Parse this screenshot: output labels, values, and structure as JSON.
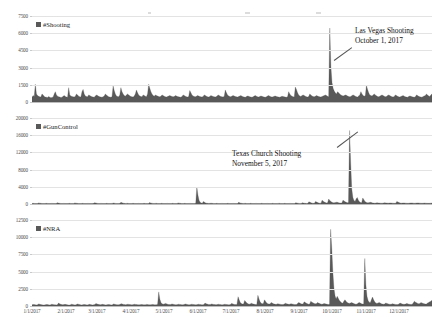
{
  "figure": {
    "background": "#ffffff",
    "series_color": "#595959",
    "grid_color": "#e3e3e3"
  },
  "top_artifacts": [
    {
      "x": 148,
      "y": 12,
      "w": 3,
      "h": 2
    },
    {
      "x": 245,
      "y": 12,
      "w": 5,
      "h": 2
    },
    {
      "x": 316,
      "y": 12,
      "w": 5,
      "h": 2
    }
  ],
  "xaxis": {
    "label": "",
    "ticks": [
      "1/1/2017",
      "2/1/2017",
      "3/1/2017",
      "4/1/2017",
      "5/1/2017",
      "6/1/2017",
      "7/1/2017",
      "8/1/2017",
      "9/1/2017",
      "10/1/2017",
      "11/1/2017",
      "12/1/2017"
    ],
    "range_start": "1/1/2017",
    "range_end": "12/31/2017"
  },
  "panels": [
    {
      "id": "shooting",
      "legend_label": "#Shooting",
      "yticks": [
        "0",
        "1500",
        "3000",
        "4500",
        "6000",
        "7500"
      ],
      "ymax": 7500,
      "annotation": {
        "line1": "Las Vegas Shooting",
        "line2": "October 1, 2017"
      }
    },
    {
      "id": "guncontrol",
      "legend_label": "#GunControl",
      "yticks": [
        "0",
        "4000",
        "8000",
        "12000",
        "16000",
        "20000"
      ],
      "ymax": 20000,
      "annotation": {
        "line1": "Texas Church Shooting",
        "line2": "November 5, 2017"
      }
    },
    {
      "id": "nra",
      "legend_label": "#NRA",
      "yticks": [
        "0",
        "2500",
        "5000",
        "7500",
        "10000",
        "12500"
      ],
      "ymax": 12500,
      "annotation": null
    }
  ],
  "chart_data": [
    {
      "type": "area",
      "id": "shooting",
      "title": "",
      "series_name": "#Shooting",
      "xlabel": "",
      "ylabel": "",
      "ylim": [
        0,
        7500
      ],
      "ytick_values": [
        0,
        1500,
        3000,
        4500,
        6000,
        7500
      ],
      "xtick_labels": [
        "1/1/2017",
        "2/1/2017",
        "3/1/2017",
        "4/1/2017",
        "5/1/2017",
        "6/1/2017",
        "7/1/2017",
        "8/1/2017",
        "9/1/2017",
        "10/1/2017",
        "11/1/2017",
        "12/1/2017"
      ],
      "grid": true,
      "legend_position": "top-left",
      "annotations": [
        {
          "text": "Las Vegas Shooting October 1, 2017",
          "x_day": 273,
          "y_value": 6400
        }
      ],
      "x_unit": "day_of_year_2017",
      "values": [
        420,
        560,
        480,
        1550,
        700,
        560,
        500,
        450,
        430,
        700,
        620,
        480,
        430,
        420,
        400,
        480,
        420,
        380,
        400,
        430,
        700,
        900,
        620,
        500,
        450,
        430,
        400,
        420,
        500,
        560,
        480,
        430,
        420,
        1250,
        620,
        520,
        480,
        450,
        430,
        500,
        700,
        620,
        500,
        460,
        430,
        900,
        1100,
        700,
        520,
        480,
        450,
        620,
        560,
        500,
        460,
        430,
        420,
        520,
        620,
        560,
        500,
        450,
        430,
        420,
        460,
        520,
        700,
        620,
        520,
        460,
        430,
        420,
        460,
        1400,
        1000,
        700,
        520,
        480,
        450,
        620,
        1250,
        900,
        700,
        560,
        500,
        620,
        700,
        620,
        540,
        480,
        450,
        430,
        520,
        700,
        1050,
        800,
        620,
        520,
        480,
        450,
        620,
        560,
        500,
        460,
        700,
        1550,
        1200,
        900,
        700,
        560,
        500,
        620,
        560,
        520,
        480,
        450,
        500,
        620,
        560,
        500,
        460,
        430,
        480,
        520,
        560,
        520,
        480,
        450,
        480,
        560,
        520,
        480,
        450,
        430,
        420,
        480,
        620,
        560,
        500,
        460,
        430,
        480,
        1000,
        800,
        620,
        520,
        480,
        450,
        500,
        560,
        520,
        480,
        450,
        430,
        480,
        620,
        560,
        500,
        460,
        430,
        480,
        560,
        520,
        480,
        450,
        430,
        480,
        560,
        620,
        520,
        480,
        450,
        430,
        500,
        1050,
        800,
        620,
        520,
        480,
        450,
        520,
        560,
        520,
        480,
        450,
        430,
        480,
        520,
        560,
        500,
        460,
        430,
        420,
        480,
        520,
        500,
        460,
        430,
        420,
        450,
        520,
        560,
        500,
        460,
        430,
        480,
        520,
        500,
        460,
        430,
        420,
        460,
        520,
        560,
        500,
        460,
        430,
        450,
        500,
        520,
        480,
        450,
        430,
        420,
        460,
        500,
        480,
        450,
        430,
        420,
        450,
        900,
        700,
        560,
        500,
        460,
        430,
        1300,
        1100,
        800,
        620,
        520,
        480,
        560,
        620,
        560,
        500,
        460,
        430,
        480,
        700,
        620,
        520,
        480,
        450,
        500,
        560,
        520,
        480,
        450,
        430,
        480,
        520,
        560,
        620,
        560,
        500,
        460,
        6450,
        3100,
        1700,
        1200,
        950,
        800,
        700,
        900,
        800,
        700,
        620,
        560,
        520,
        560,
        620,
        580,
        520,
        480,
        450,
        480,
        560,
        620,
        560,
        500,
        460,
        430,
        520,
        620,
        900,
        700,
        560,
        500,
        560,
        1450,
        1100,
        800,
        620,
        560,
        520,
        620,
        700,
        620,
        540,
        480,
        450,
        500,
        560,
        620,
        560,
        500,
        460,
        480,
        560,
        620,
        560,
        500,
        460,
        430,
        480,
        620,
        560,
        500,
        460,
        430,
        480,
        520,
        560,
        500,
        460,
        430,
        420,
        480,
        520,
        500,
        460,
        430,
        420,
        450,
        620,
        560,
        500,
        460,
        430,
        420,
        480,
        520,
        560,
        700,
        620,
        520,
        480,
        620,
        700
      ]
    },
    {
      "type": "area",
      "id": "guncontrol",
      "title": "",
      "series_name": "#GunControl",
      "xlabel": "",
      "ylabel": "",
      "ylim": [
        0,
        20000
      ],
      "ytick_values": [
        0,
        4000,
        8000,
        12000,
        16000,
        20000
      ],
      "xtick_labels": [
        "1/1/2017",
        "2/1/2017",
        "3/1/2017",
        "4/1/2017",
        "5/1/2017",
        "6/1/2017",
        "7/1/2017",
        "8/1/2017",
        "9/1/2017",
        "10/1/2017",
        "11/1/2017",
        "12/1/2017"
      ],
      "grid": true,
      "legend_position": "top-left",
      "annotations": [
        {
          "text": "Texas Church Shooting November 5, 2017",
          "x_day": 309,
          "y_value": 17000
        }
      ],
      "x_unit": "day_of_year_2017",
      "values": [
        120,
        150,
        130,
        110,
        100,
        120,
        260,
        200,
        150,
        130,
        110,
        100,
        120,
        150,
        130,
        110,
        100,
        120,
        140,
        120,
        110,
        100,
        120,
        300,
        220,
        160,
        130,
        110,
        120,
        140,
        120,
        110,
        100,
        120,
        150,
        130,
        110,
        100,
        120,
        260,
        200,
        150,
        120,
        110,
        100,
        120,
        150,
        130,
        110,
        100,
        120,
        140,
        120,
        110,
        100,
        120,
        150,
        300,
        230,
        170,
        130,
        110,
        120,
        140,
        120,
        110,
        100,
        120,
        150,
        130,
        110,
        100,
        120,
        140,
        220,
        180,
        140,
        120,
        110,
        120,
        150,
        380,
        280,
        200,
        150,
        120,
        140,
        160,
        130,
        110,
        100,
        120,
        150,
        130,
        110,
        100,
        120,
        140,
        120,
        110,
        100,
        120,
        150,
        130,
        110,
        100,
        120,
        320,
        240,
        180,
        140,
        120,
        140,
        160,
        130,
        110,
        100,
        120,
        150,
        130,
        110,
        100,
        120,
        140,
        120,
        110,
        100,
        120,
        150,
        130,
        110,
        100,
        120,
        260,
        200,
        150,
        120,
        110,
        120,
        150,
        130,
        110,
        100,
        120,
        140,
        120,
        110,
        100,
        120,
        150,
        3950,
        2100,
        900,
        400,
        250,
        200,
        600,
        400,
        250,
        180,
        150,
        130,
        160,
        180,
        150,
        130,
        110,
        120,
        150,
        130,
        110,
        100,
        120,
        140,
        120,
        110,
        100,
        120,
        150,
        130,
        110,
        100,
        120,
        140,
        120,
        110,
        100,
        120,
        380,
        280,
        200,
        150,
        120,
        140,
        160,
        130,
        110,
        100,
        120,
        150,
        130,
        110,
        100,
        120,
        140,
        120,
        110,
        100,
        120,
        150,
        130,
        110,
        100,
        120,
        140,
        120,
        110,
        100,
        120,
        150,
        130,
        110,
        100,
        120,
        140,
        160,
        130,
        110,
        100,
        120,
        150,
        130,
        110,
        100,
        120,
        140,
        120,
        110,
        100,
        120,
        300,
        240,
        180,
        140,
        120,
        140,
        300,
        240,
        180,
        150,
        130,
        150,
        520,
        380,
        280,
        200,
        160,
        180,
        600,
        450,
        320,
        240,
        180,
        200,
        900,
        650,
        480,
        340,
        260,
        300,
        1150,
        800,
        560,
        400,
        300,
        280,
        350,
        420,
        380,
        300,
        250,
        220,
        260,
        900,
        700,
        500,
        380,
        300,
        320,
        17100,
        9500,
        3500,
        1500,
        800,
        600,
        1200,
        1500,
        900,
        500,
        350,
        300,
        1400,
        1000,
        600,
        400,
        300,
        280,
        350,
        400,
        320,
        260,
        220,
        200,
        240,
        300,
        260,
        220,
        200,
        180,
        200,
        260,
        300,
        260,
        220,
        200,
        220,
        260,
        240,
        200,
        180,
        160,
        180,
        600,
        450,
        320,
        240,
        200,
        220,
        260,
        240,
        200,
        180,
        160,
        180,
        220,
        260,
        240,
        200,
        180,
        200,
        240,
        260,
        240,
        200,
        180,
        160,
        180,
        220,
        200,
        180,
        160,
        150,
        170,
        200,
        220
      ]
    },
    {
      "type": "area",
      "id": "nra",
      "title": "",
      "series_name": "#NRA",
      "xlabel": "",
      "ylabel": "",
      "ylim": [
        0,
        12500
      ],
      "ytick_values": [
        0,
        2500,
        5000,
        7500,
        10000,
        12500
      ],
      "xtick_labels": [
        "1/1/2017",
        "2/1/2017",
        "3/1/2017",
        "4/1/2017",
        "5/1/2017",
        "6/1/2017",
        "7/1/2017",
        "8/1/2017",
        "9/1/2017",
        "10/1/2017",
        "11/1/2017",
        "12/1/2017"
      ],
      "grid": true,
      "legend_position": "top-left",
      "annotations": [],
      "x_unit": "day_of_year_2017",
      "values": [
        180,
        220,
        200,
        170,
        160,
        180,
        300,
        260,
        200,
        180,
        160,
        150,
        180,
        220,
        200,
        170,
        160,
        180,
        260,
        220,
        190,
        170,
        160,
        180,
        420,
        340,
        260,
        200,
        180,
        200,
        240,
        200,
        180,
        160,
        150,
        180,
        260,
        220,
        180,
        160,
        180,
        300,
        260,
        220,
        180,
        160,
        180,
        220,
        200,
        170,
        160,
        180,
        240,
        200,
        180,
        160,
        180,
        220,
        380,
        300,
        240,
        200,
        180,
        200,
        240,
        200,
        180,
        160,
        180,
        220,
        200,
        180,
        160,
        180,
        300,
        260,
        220,
        190,
        170,
        190,
        260,
        340,
        280,
        230,
        200,
        180,
        220,
        260,
        230,
        200,
        180,
        170,
        200,
        260,
        230,
        200,
        180,
        170,
        190,
        230,
        200,
        180,
        170,
        190,
        230,
        200,
        180,
        170,
        190,
        230,
        200,
        180,
        170,
        190,
        260,
        2050,
        1000,
        500,
        320,
        260,
        300,
        380,
        320,
        260,
        220,
        200,
        220,
        300,
        260,
        220,
        190,
        180,
        200,
        260,
        230,
        200,
        180,
        170,
        200,
        300,
        260,
        220,
        190,
        180,
        200,
        260,
        230,
        200,
        180,
        170,
        200,
        260,
        230,
        200,
        180,
        170,
        200,
        420,
        340,
        280,
        230,
        200,
        230,
        300,
        260,
        220,
        200,
        180,
        200,
        260,
        230,
        200,
        180,
        170,
        200,
        260,
        230,
        200,
        180,
        170,
        200,
        380,
        320,
        260,
        220,
        200,
        230,
        1350,
        900,
        500,
        350,
        280,
        300,
        800,
        600,
        420,
        320,
        260,
        300,
        400,
        340,
        280,
        240,
        200,
        230,
        1550,
        1000,
        600,
        400,
        320,
        360,
        900,
        650,
        450,
        340,
        280,
        300,
        500,
        420,
        340,
        280,
        240,
        260,
        340,
        300,
        260,
        230,
        200,
        220,
        300,
        400,
        340,
        280,
        240,
        260,
        340,
        300,
        260,
        230,
        200,
        220,
        380,
        500,
        420,
        340,
        280,
        300,
        600,
        500,
        400,
        320,
        260,
        280,
        700,
        560,
        460,
        380,
        320,
        340,
        500,
        420,
        360,
        300,
        260,
        280,
        360,
        320,
        280,
        240,
        220,
        240,
        11150,
        8500,
        5000,
        2600,
        1500,
        1000,
        1400,
        1100,
        800,
        600,
        460,
        400,
        700,
        900,
        700,
        520,
        420,
        380,
        420,
        500,
        420,
        360,
        300,
        260,
        300,
        420,
        500,
        420,
        340,
        280,
        300,
        6900,
        3100,
        1400,
        800,
        560,
        460,
        900,
        1300,
        900,
        600,
        450,
        380,
        420,
        500,
        420,
        340,
        290,
        260,
        300,
        420,
        380,
        320,
        270,
        240,
        260,
        340,
        300,
        260,
        230,
        200,
        220,
        300,
        420,
        360,
        300,
        260,
        240,
        280,
        360,
        320,
        270,
        240,
        220,
        250,
        420,
        700,
        560,
        460,
        380,
        320,
        360,
        500,
        440,
        380,
        320,
        280,
        300,
        420,
        500,
        620,
        700,
        820
      ]
    }
  ]
}
